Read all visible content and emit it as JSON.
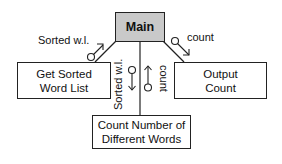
{
  "diagram": {
    "type": "structure-chart",
    "modules": {
      "main": "Main",
      "get_sorted": [
        "Get Sorted",
        "Word List"
      ],
      "output_count": [
        "Output",
        "Count"
      ],
      "count_words": [
        "Count Number of",
        "Different Words"
      ]
    },
    "couples": {
      "main_left": "Sorted w.l.",
      "main_right": "count",
      "bottom_left": "Sorted w.l.",
      "bottom_right": "count"
    },
    "colors": {
      "main_fill": "#c9c9c9",
      "line": "#222222"
    }
  }
}
